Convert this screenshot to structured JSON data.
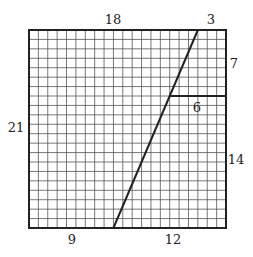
{
  "diagram": {
    "grid": {
      "columns": 21,
      "rows": 21,
      "left": 29,
      "top": 30,
      "right": 226,
      "bottom": 228
    },
    "diagonal_line": {
      "bottom_offset_cells": 9,
      "top_offset_cells": 18
    },
    "horizontal_segment": {
      "row_from_top": 7,
      "length_cells": 6
    },
    "labels": {
      "top_left": "18",
      "top_right": "3",
      "right_upper": "7",
      "segment": "6",
      "left": "21",
      "right_lower": "14",
      "bottom_left": "9",
      "bottom_right": "12"
    },
    "colors": {
      "grid_line": "#555555",
      "border": "#222222",
      "text": "#222222"
    }
  }
}
